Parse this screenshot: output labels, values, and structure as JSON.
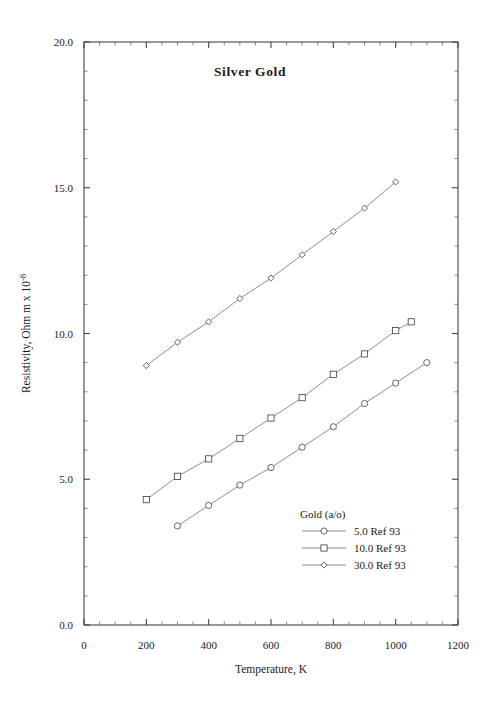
{
  "chart_data": {
    "type": "line",
    "title": "Silver  Gold",
    "xlabel": "Temperature,  K",
    "ylabel": "Resistivity, Ohm m x 10",
    "ylabel_exponent": "-8",
    "xlim": [
      0,
      1200
    ],
    "ylim": [
      0.0,
      20.0
    ],
    "xticks": [
      0,
      200,
      400,
      600,
      800,
      1000,
      1200
    ],
    "xtick_labels": [
      "0",
      "200",
      "400",
      "600",
      "800",
      "1000",
      "1200"
    ],
    "yticks": [
      0.0,
      5.0,
      10.0,
      15.0,
      20.0
    ],
    "ytick_labels": [
      "0.0",
      "5.0",
      "10.0",
      "15.0",
      "20.0"
    ],
    "x_minor_step": 50,
    "y_minor_step": 1.0,
    "grid": false,
    "legend_title": "Gold  (a/o)",
    "legend_position": "inside-lower-right",
    "series": [
      {
        "name": "5.0 Ref 93",
        "marker": "circle",
        "x": [
          300,
          400,
          500,
          600,
          700,
          800,
          900,
          1000,
          1100
        ],
        "y": [
          3.4,
          4.1,
          4.8,
          5.4,
          6.1,
          6.8,
          7.6,
          8.3,
          9.0
        ]
      },
      {
        "name": "10.0 Ref 93",
        "marker": "square",
        "x": [
          200,
          300,
          400,
          500,
          600,
          700,
          800,
          900,
          1000,
          1050
        ],
        "y": [
          4.3,
          5.1,
          5.7,
          6.4,
          7.1,
          7.8,
          8.6,
          9.3,
          10.1,
          10.4
        ]
      },
      {
        "name": "30.0 Ref 93",
        "marker": "diamond",
        "x": [
          200,
          300,
          400,
          500,
          600,
          700,
          800,
          900,
          1000
        ],
        "y": [
          8.9,
          9.7,
          10.4,
          11.2,
          11.9,
          12.7,
          13.5,
          14.3,
          15.2
        ]
      }
    ]
  },
  "colors": {
    "axis": "#444444",
    "line": "#7a7a7a",
    "marker_stroke": "#4a4a4a",
    "text": "#1a1a1a",
    "background": "#ffffff"
  }
}
